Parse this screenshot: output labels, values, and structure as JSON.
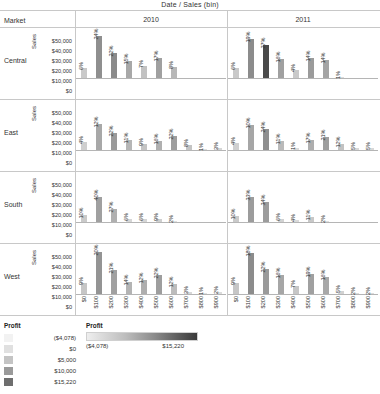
{
  "header": {
    "columns_title": "Date  /  Sales (bin)",
    "market_header": "Market",
    "years": [
      "2010",
      "2011"
    ]
  },
  "axis": {
    "y_title": "Sales",
    "y_ticks": [
      "$50,000",
      "$40,000",
      "$30,000",
      "$20,000",
      "$10,000",
      "$0"
    ],
    "y_max": 50000,
    "x_ticks": [
      "$0",
      "$100",
      "$200",
      "$300",
      "$400",
      "$500",
      "$600",
      "$700",
      "$800",
      "$900"
    ]
  },
  "legend_discrete": {
    "title": "Profit",
    "entries": [
      {
        "label": "($4,078)",
        "color": "#f2f2f2"
      },
      {
        "label": "$0",
        "color": "#e0e0e0"
      },
      {
        "label": "$5,000",
        "color": "#c4c4c4"
      },
      {
        "label": "$10,000",
        "color": "#9a9a9a"
      },
      {
        "label": "$15,220",
        "color": "#6e6e6e"
      }
    ]
  },
  "legend_continuous": {
    "title": "Profit",
    "min_label": "($4,078)",
    "max_label": "$15,220",
    "low_color": "#eeeeee",
    "high_color": "#3a3a3a"
  },
  "chart_data": {
    "type": "bar",
    "title": "Date  /  Sales (bin)",
    "xlabel": "Sales (bin)",
    "ylabel": "Sales",
    "ylim": [
      0,
      50000
    ],
    "grid": false,
    "legend_position": "bottom-left",
    "rows": [
      "Central",
      "East",
      "South",
      "West"
    ],
    "columns": [
      "2010",
      "2011"
    ],
    "categories": [
      "$0",
      "$100",
      "$200",
      "$300",
      "$400",
      "$500",
      "$600",
      "$700",
      "$800",
      "$900"
    ],
    "panels": [
      {
        "row": "Central",
        "column": "2010",
        "bars": [
          {
            "x": "$0",
            "sales": 10000,
            "pct": "6%",
            "profit_shade": "#c9c9c9"
          },
          {
            "x": "$100",
            "sales": 42000,
            "pct": "24%",
            "profit_shade": "#8f8f8f"
          },
          {
            "x": "$200",
            "sales": 24500,
            "pct": "22%",
            "profit_shade": "#8a8a8a"
          },
          {
            "x": "$300",
            "sales": 17000,
            "pct": "15%",
            "profit_shade": "#a8a8a8"
          },
          {
            "x": "$400",
            "sales": 11500,
            "pct": "7%",
            "profit_shade": "#c2c2c2"
          },
          {
            "x": "$500",
            "sales": 20000,
            "pct": "17%",
            "profit_shade": "#a0a0a0"
          },
          {
            "x": "$600",
            "sales": 11000,
            "pct": "8%",
            "profit_shade": "#b8b8b8"
          },
          {
            "x": "$700",
            "sales": 0,
            "pct": "",
            "profit_shade": "#ffffff"
          },
          {
            "x": "$800",
            "sales": 0,
            "pct": "",
            "profit_shade": "#ffffff"
          },
          {
            "x": "$900",
            "sales": 0,
            "pct": "",
            "profit_shade": "#ffffff"
          }
        ]
      },
      {
        "row": "Central",
        "column": "2011",
        "bars": [
          {
            "x": "$0",
            "sales": 10000,
            "pct": "6%",
            "profit_shade": "#c9c9c9"
          },
          {
            "x": "$100",
            "sales": 38500,
            "pct": "19%",
            "profit_shade": "#8c8c8c"
          },
          {
            "x": "$200",
            "sales": 32500,
            "pct": "27%",
            "profit_shade": "#4a4a4a"
          },
          {
            "x": "$300",
            "sales": 18500,
            "pct": "16%",
            "profit_shade": "#a0a0a0"
          },
          {
            "x": "$400",
            "sales": 8000,
            "pct": "4%",
            "profit_shade": "#c9c9c9"
          },
          {
            "x": "$500",
            "sales": 19500,
            "pct": "14%",
            "profit_shade": "#9b9b9b"
          },
          {
            "x": "$600",
            "sales": 17500,
            "pct": "14%",
            "profit_shade": "#a4a4a4"
          },
          {
            "x": "$700",
            "sales": 1200,
            "pct": "1%",
            "profit_shade": "#dcdcdc"
          },
          {
            "x": "$800",
            "sales": 0,
            "pct": "",
            "profit_shade": "#ffffff"
          },
          {
            "x": "$900",
            "sales": 0,
            "pct": "",
            "profit_shade": "#ffffff"
          }
        ]
      },
      {
        "row": "East",
        "column": "2010",
        "bars": [
          {
            "x": "$0",
            "sales": 7500,
            "pct": "4%",
            "profit_shade": "#cfcfcf"
          },
          {
            "x": "$100",
            "sales": 25500,
            "pct": "12%",
            "profit_shade": "#a8a8a8"
          },
          {
            "x": "$200",
            "sales": 16500,
            "pct": "22%",
            "profit_shade": "#9a9a9a"
          },
          {
            "x": "$300",
            "sales": 9500,
            "pct": "11%",
            "profit_shade": "#b6b6b6"
          },
          {
            "x": "$400",
            "sales": 5500,
            "pct": "9%",
            "profit_shade": "#c4c4c4"
          },
          {
            "x": "$500",
            "sales": 8500,
            "pct": "16%",
            "profit_shade": "#b0b0b0"
          },
          {
            "x": "$600",
            "sales": 13500,
            "pct": "22%",
            "profit_shade": "#9e9e9e"
          },
          {
            "x": "$700",
            "sales": 5000,
            "pct": "8%",
            "profit_shade": "#c4c4c4"
          },
          {
            "x": "$800",
            "sales": 1200,
            "pct": "1%",
            "profit_shade": "#dedede"
          },
          {
            "x": "$900",
            "sales": 2000,
            "pct": "3%",
            "profit_shade": "#d6d6d6"
          }
        ]
      },
      {
        "row": "East",
        "column": "2011",
        "bars": [
          {
            "x": "$0",
            "sales": 7000,
            "pct": "4%",
            "profit_shade": "#d0d0d0"
          },
          {
            "x": "$100",
            "sales": 25000,
            "pct": "10%",
            "profit_shade": "#a6a6a6"
          },
          {
            "x": "$200",
            "sales": 21000,
            "pct": "24%",
            "profit_shade": "#8f8f8f"
          },
          {
            "x": "$300",
            "sales": 9000,
            "pct": "11%",
            "profit_shade": "#bababa"
          },
          {
            "x": "$400",
            "sales": 2000,
            "pct": "1%",
            "profit_shade": "#dcdcdc"
          },
          {
            "x": "$500",
            "sales": 10000,
            "pct": "17%",
            "profit_shade": "#aeaeae"
          },
          {
            "x": "$600",
            "sales": 13000,
            "pct": "21%",
            "profit_shade": "#9e9e9e"
          },
          {
            "x": "$700",
            "sales": 6000,
            "pct": "12%",
            "profit_shade": "#c2c2c2"
          },
          {
            "x": "$800",
            "sales": 2200,
            "pct": "5%",
            "profit_shade": "#d8d8d8"
          },
          {
            "x": "$900",
            "sales": 2200,
            "pct": "5%",
            "profit_shade": "#d8d8d8"
          }
        ]
      },
      {
        "row": "South",
        "column": "2010",
        "bars": [
          {
            "x": "$0",
            "sales": 6500,
            "pct": "10%",
            "profit_shade": "#cacaca"
          },
          {
            "x": "$100",
            "sales": 25000,
            "pct": "40%",
            "profit_shade": "#a0a0a0"
          },
          {
            "x": "$200",
            "sales": 13000,
            "pct": "27%",
            "profit_shade": "#b0b0b0"
          },
          {
            "x": "$300",
            "sales": 2500,
            "pct": "6%",
            "profit_shade": "#d6d6d6"
          },
          {
            "x": "$400",
            "sales": 2500,
            "pct": "6%",
            "profit_shade": "#d6d6d6"
          },
          {
            "x": "$500",
            "sales": 3000,
            "pct": "9%",
            "profit_shade": "#cfcfcf"
          },
          {
            "x": "$600",
            "sales": 1200,
            "pct": "2%",
            "profit_shade": "#e0e0e0"
          },
          {
            "x": "$700",
            "sales": 0,
            "pct": "",
            "profit_shade": "#ffffff"
          },
          {
            "x": "$800",
            "sales": 0,
            "pct": "",
            "profit_shade": "#ffffff"
          },
          {
            "x": "$900",
            "sales": 0,
            "pct": "",
            "profit_shade": "#ffffff"
          }
        ]
      },
      {
        "row": "South",
        "column": "2011",
        "bars": [
          {
            "x": "$0",
            "sales": 6000,
            "pct": "10%",
            "profit_shade": "#cacaca"
          },
          {
            "x": "$100",
            "sales": 24500,
            "pct": "33%",
            "profit_shade": "#9c9c9c"
          },
          {
            "x": "$200",
            "sales": 19500,
            "pct": "34%",
            "profit_shade": "#9c9c9c"
          },
          {
            "x": "$300",
            "sales": 3000,
            "pct": "6%",
            "profit_shade": "#d2d2d2"
          },
          {
            "x": "$400",
            "sales": 1800,
            "pct": "4%",
            "profit_shade": "#dadada"
          },
          {
            "x": "$500",
            "sales": 4500,
            "pct": "11%",
            "profit_shade": "#c8c8c8"
          },
          {
            "x": "$600",
            "sales": 1400,
            "pct": "2%",
            "profit_shade": "#e0e0e0"
          },
          {
            "x": "$700",
            "sales": 0,
            "pct": "",
            "profit_shade": "#ffffff"
          },
          {
            "x": "$800",
            "sales": 0,
            "pct": "",
            "profit_shade": "#ffffff"
          },
          {
            "x": "$900",
            "sales": 0,
            "pct": "",
            "profit_shade": "#ffffff"
          }
        ]
      },
      {
        "row": "West",
        "column": "2010",
        "bars": [
          {
            "x": "$0",
            "sales": 11000,
            "pct": "9%",
            "profit_shade": "#c6c6c6"
          },
          {
            "x": "$100",
            "sales": 41500,
            "pct": "20%",
            "profit_shade": "#949494"
          },
          {
            "x": "$200",
            "sales": 24000,
            "pct": "21%",
            "profit_shade": "#a0a0a0"
          },
          {
            "x": "$300",
            "sales": 12000,
            "pct": "14%",
            "profit_shade": "#b4b4b4"
          },
          {
            "x": "$400",
            "sales": 14500,
            "pct": "12%",
            "profit_shade": "#aeaeae"
          },
          {
            "x": "$500",
            "sales": 19000,
            "pct": "22%",
            "profit_shade": "#9e9e9e"
          },
          {
            "x": "$600",
            "sales": 10000,
            "pct": "12%",
            "profit_shade": "#bcbcbc"
          },
          {
            "x": "$700",
            "sales": 2000,
            "pct": "3%",
            "profit_shade": "#d8d8d8"
          },
          {
            "x": "$800",
            "sales": 1200,
            "pct": "1%",
            "profit_shade": "#e0e0e0"
          },
          {
            "x": "$900",
            "sales": 1500,
            "pct": "2%",
            "profit_shade": "#dcdcdc"
          }
        ]
      },
      {
        "row": "West",
        "column": "2011",
        "bars": [
          {
            "x": "$0",
            "sales": 10500,
            "pct": "9%",
            "profit_shade": "#c6c6c6"
          },
          {
            "x": "$100",
            "sales": 40500,
            "pct": "18%",
            "profit_shade": "#8c8c8c"
          },
          {
            "x": "$200",
            "sales": 24500,
            "pct": "22%",
            "profit_shade": "#9a9a9a"
          },
          {
            "x": "$300",
            "sales": 19000,
            "pct": "16%",
            "profit_shade": "#a6a6a6"
          },
          {
            "x": "$400",
            "sales": 8000,
            "pct": "7%",
            "profit_shade": "#c6c6c6"
          },
          {
            "x": "$500",
            "sales": 20000,
            "pct": "19%",
            "profit_shade": "#a0a0a0"
          },
          {
            "x": "$600",
            "sales": 17000,
            "pct": "16%",
            "profit_shade": "#a8a8a8"
          },
          {
            "x": "$700",
            "sales": 3000,
            "pct": "5%",
            "profit_shade": "#d2d2d2"
          },
          {
            "x": "$800",
            "sales": 1400,
            "pct": "2%",
            "profit_shade": "#dcdcdc"
          },
          {
            "x": "$900",
            "sales": 1400,
            "pct": "2%",
            "profit_shade": "#dcdcdc"
          }
        ]
      }
    ]
  }
}
